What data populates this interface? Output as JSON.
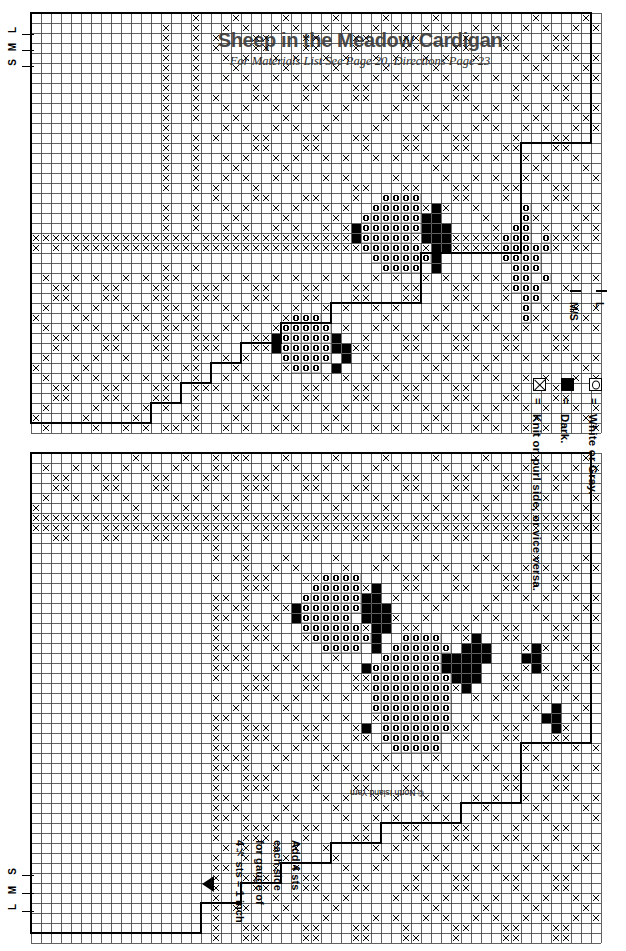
{
  "document": {
    "title": "Sheep in the Meadow Cardigan",
    "subtitle": "For Materials List See Page 20, Directions Page 23",
    "copyright": "© North Island Yarn"
  },
  "left_sizes_top": [
    {
      "label": "L"
    },
    {
      "label": "M"
    },
    {
      "label": "S"
    }
  ],
  "left_sizes_bottom": [
    {
      "label": "S"
    },
    {
      "label": "M"
    },
    {
      "label": "L"
    }
  ],
  "right_sizes": [
    {
      "label": "L",
      "marker": "dash"
    },
    {
      "label": "M/S",
      "marker": "dash"
    }
  ],
  "legend": {
    "items": [
      {
        "symbol": "open-circle-cell-icon",
        "equals": "=",
        "text": "White or Gray."
      },
      {
        "symbol": "dark-filled-cell-icon",
        "equals": "=",
        "text": "Dark."
      },
      {
        "symbol": "x-stitch-cell-icon",
        "equals": "=",
        "text": "Knit on purl side, or vice versa."
      }
    ]
  },
  "gauge_note": {
    "lines": [
      "Add 4 sts",
      "each side",
      "for gauge of",
      "4½ sts = 1 inch"
    ],
    "arrow": "triangle-left-icon"
  },
  "chart_data": {
    "type": "heatmap",
    "title": "Sheep in the Meadow Cardigan",
    "subtitle": "For Materials List See Page 20, Directions Page 23",
    "grid": {
      "cell_px": 10,
      "line_color": "#222222",
      "background": "#ffffff"
    },
    "symbols": {
      "blank": "White or Gray.",
      "o": "White or Gray.",
      "d": "Dark.",
      "x": "Knit on purl side, or vice versa."
    },
    "charts": [
      {
        "name": "upper-chart-back-and-sleeve",
        "origin": {
          "x": 30,
          "y": 12
        },
        "cols": 57,
        "rows": 42,
        "outline_steps": [
          [
            1,
            42,
            13,
            42
          ],
          [
            13,
            42,
            13,
            40
          ],
          [
            13,
            40,
            16,
            40
          ],
          [
            16,
            40,
            16,
            38
          ],
          [
            16,
            38,
            19,
            38
          ],
          [
            19,
            38,
            19,
            36
          ],
          [
            19,
            36,
            22,
            36
          ],
          [
            22,
            36,
            22,
            34
          ],
          [
            22,
            34,
            26,
            34
          ],
          [
            26,
            34,
            26,
            32
          ],
          [
            26,
            32,
            31,
            32
          ],
          [
            31,
            32,
            31,
            30
          ],
          [
            31,
            30,
            40,
            30
          ],
          [
            40,
            30,
            40,
            25
          ],
          [
            40,
            25,
            50,
            25
          ],
          [
            50,
            25,
            50,
            14
          ],
          [
            50,
            14,
            57,
            14
          ],
          [
            57,
            14,
            57,
            1
          ],
          [
            57,
            1,
            1,
            1
          ],
          [
            1,
            1,
            1,
            42
          ]
        ],
        "vertical_x_bands": [
          14,
          17
        ],
        "horizontal_x_bands": [
          23,
          24
        ],
        "motifs": [
          {
            "kind": "sheep",
            "col": 32,
            "row": 18,
            "facing": "left"
          },
          {
            "kind": "sheep-small",
            "col": 24,
            "row": 30,
            "facing": "left"
          },
          {
            "kind": "sheep-partial",
            "col": 47,
            "row": 19,
            "facing": "left"
          }
        ]
      },
      {
        "name": "lower-chart-front",
        "origin": {
          "x": 30,
          "y": 452
        },
        "cols": 57,
        "rows": 49,
        "outline_steps": [
          [
            1,
            1,
            57,
            1
          ],
          [
            57,
            1,
            57,
            30
          ],
          [
            57,
            30,
            50,
            30
          ],
          [
            50,
            30,
            50,
            36
          ],
          [
            50,
            36,
            44,
            36
          ],
          [
            44,
            36,
            44,
            38
          ],
          [
            44,
            38,
            36,
            38
          ],
          [
            36,
            38,
            36,
            40
          ],
          [
            36,
            40,
            31,
            40
          ],
          [
            31,
            40,
            31,
            42
          ],
          [
            31,
            42,
            26,
            42
          ],
          [
            26,
            42,
            26,
            44
          ],
          [
            26,
            44,
            22,
            44
          ],
          [
            22,
            44,
            22,
            46
          ],
          [
            22,
            46,
            18,
            46
          ],
          [
            18,
            46,
            18,
            49
          ],
          [
            18,
            49,
            1,
            49
          ],
          [
            1,
            49,
            1,
            1
          ]
        ],
        "vertical_x_bands": [
          19,
          22
        ],
        "horizontal_x_bands": [
          7,
          8
        ],
        "motifs": [
          {
            "kind": "sheep",
            "col": 26,
            "row": 12,
            "facing": "left"
          },
          {
            "kind": "sheep-large",
            "col": 33,
            "row": 18,
            "facing": "left"
          },
          {
            "kind": "dark-cluster",
            "col": 49,
            "row": 19
          },
          {
            "kind": "dark-cluster",
            "col": 51,
            "row": 25
          }
        ]
      }
    ]
  }
}
